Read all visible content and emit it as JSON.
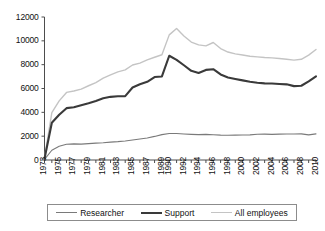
{
  "chart_data": {
    "type": "line",
    "title": "",
    "xlabel": "",
    "ylabel": "",
    "ylim": [
      0,
      12000
    ],
    "ytick_values": [
      0,
      2000,
      4000,
      6000,
      8000,
      10000,
      12000
    ],
    "ytick_labels": [
      "0",
      "2000",
      "4000",
      "6000",
      "8000",
      "10000",
      "12000"
    ],
    "xlim": [
      1973,
      2010
    ],
    "grid": false,
    "legend_position": "bottom",
    "xtick_labels": [
      "1973",
      "1975",
      "1977",
      "1979",
      "1981",
      "1983",
      "1985",
      "1987",
      "1989",
      "1990",
      "1992",
      "1994",
      "1996",
      "1998",
      "2000",
      "2002",
      "2004",
      "2006",
      "2008",
      "2010"
    ],
    "xtick_values": [
      1973,
      1975,
      1977,
      1979,
      1981,
      1983,
      1985,
      1987,
      1989,
      1990,
      1992,
      1994,
      1996,
      1998,
      2000,
      2002,
      2004,
      2006,
      2008,
      2010
    ],
    "x": [
      1973,
      1974,
      1975,
      1976,
      1977,
      1978,
      1979,
      1980,
      1981,
      1982,
      1983,
      1984,
      1985,
      1986,
      1987,
      1988,
      1989,
      1990,
      1991,
      1992,
      1993,
      1994,
      1995,
      1996,
      1997,
      1998,
      1999,
      2000,
      2001,
      2002,
      2003,
      2004,
      2005,
      2006,
      2007,
      2008,
      2009,
      2010
    ],
    "series": [
      {
        "name": "Researcher",
        "color": "#7a7a7a",
        "line_width": 1.1,
        "values": [
          60,
          820,
          1150,
          1320,
          1350,
          1330,
          1370,
          1420,
          1450,
          1500,
          1540,
          1600,
          1680,
          1760,
          1850,
          1980,
          2130,
          2230,
          2220,
          2180,
          2150,
          2130,
          2150,
          2120,
          2090,
          2080,
          2090,
          2100,
          2110,
          2160,
          2170,
          2150,
          2170,
          2180,
          2180,
          2190,
          2110,
          2190
        ]
      },
      {
        "name": "Support",
        "color": "#3a3a3a",
        "line_width": 2.1,
        "values": [
          110,
          3130,
          3800,
          4350,
          4430,
          4600,
          4760,
          4950,
          5180,
          5300,
          5350,
          5360,
          6080,
          6350,
          6560,
          6960,
          7010,
          8750,
          8400,
          7950,
          7480,
          7300,
          7560,
          7620,
          7180,
          6930,
          6800,
          6680,
          6560,
          6480,
          6430,
          6420,
          6380,
          6350,
          6200,
          6230,
          6600,
          7020
        ]
      },
      {
        "name": "All employees",
        "color": "#c4c4c4",
        "line_width": 1.4,
        "values": [
          170,
          3980,
          4960,
          5670,
          5790,
          5950,
          6230,
          6500,
          6870,
          7150,
          7400,
          7560,
          7970,
          8130,
          8400,
          8620,
          8830,
          10500,
          11040,
          10400,
          9900,
          9660,
          9580,
          9860,
          9350,
          9060,
          8910,
          8810,
          8710,
          8650,
          8600,
          8570,
          8520,
          8450,
          8380,
          8450,
          8800,
          9270
        ]
      }
    ]
  }
}
